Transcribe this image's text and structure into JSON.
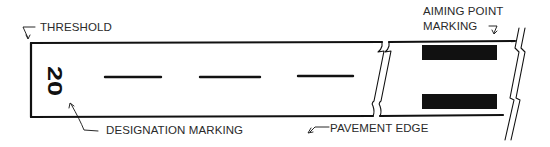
{
  "diagram": {
    "colors": {
      "line": "#111111",
      "text": "#2a2a2a",
      "background": "#ffffff"
    },
    "runway_designation": "20",
    "labels": {
      "threshold": "THRESHOLD",
      "aiming_point_line1": "AIMING POINT",
      "aiming_point_line2": "MARKING",
      "designation": "DESIGNATION MARKING",
      "pavement_edge": "PAVEMENT EDGE"
    },
    "centerline_dashes": [
      {
        "x1": 105,
        "x2": 161
      },
      {
        "x1": 200,
        "x2": 260
      },
      {
        "x1": 298,
        "x2": 353
      }
    ],
    "aiming_point_bars": [
      {
        "x": 422,
        "y": 45,
        "w": 75,
        "h": 15
      },
      {
        "x": 422,
        "y": 94,
        "w": 75,
        "h": 15
      }
    ]
  }
}
